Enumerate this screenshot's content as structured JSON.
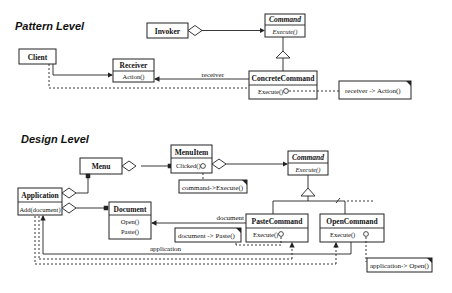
{
  "pattern": {
    "title": "Pattern Level",
    "invoker": "Invoker",
    "command": {
      "name": "Command",
      "op": "Execute()"
    },
    "client": "Client",
    "receiver": {
      "name": "Receiver",
      "op": "Action()"
    },
    "concrete": {
      "name": "ConcreteCommand",
      "op": "Execute()"
    },
    "receiver_role": "receiver",
    "note": "receiver -> Action()"
  },
  "design": {
    "title": "Design Level",
    "menu": "Menu",
    "menuitem": {
      "name": "MenuItem",
      "op": "Clicked()"
    },
    "menuitem_note": "command->Execute()",
    "command": {
      "name": "Command",
      "op": "Execute()"
    },
    "application": {
      "name": "Application",
      "op": "Add(document)"
    },
    "document": {
      "name": "Document",
      "ops": [
        "Open()",
        "Paste()"
      ]
    },
    "paste": {
      "name": "PasteCommand",
      "op": "Execute()"
    },
    "open": {
      "name": "OpenCommand",
      "op": "Execute()"
    },
    "document_role": "document",
    "application_role": "application",
    "paste_note": "document -> Paste()",
    "open_note": "application-> Open()"
  }
}
